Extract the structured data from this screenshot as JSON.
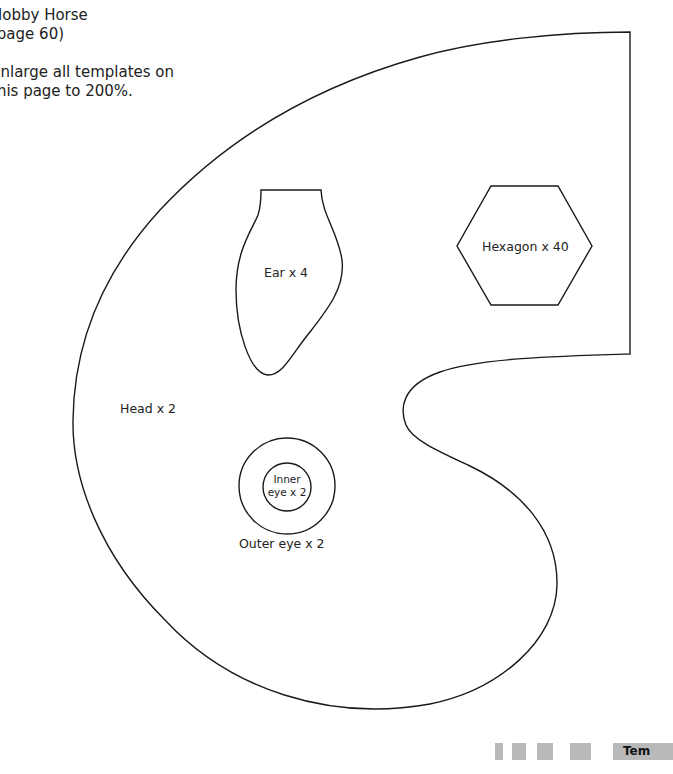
{
  "header": {
    "title_line1": "Hobby Horse",
    "title_line2": "(page 60)",
    "instruction_line1": "Enlarge all templates on",
    "instruction_line2": "this page to 200%."
  },
  "templates": {
    "head": {
      "label": "Head x 2"
    },
    "ear": {
      "label": "Ear x 4"
    },
    "hexagon": {
      "label": "Hexagon x 40"
    },
    "outer_eye": {
      "label": "Outer eye x 2"
    },
    "inner_eye": {
      "label_line1": "Inner",
      "label_line2": "eye x 2"
    }
  },
  "footer": {
    "section_label": "Tem",
    "bar_color": "#b9b9b9"
  },
  "colors": {
    "outline": "#1a1a1a",
    "background": "#ffffff"
  }
}
